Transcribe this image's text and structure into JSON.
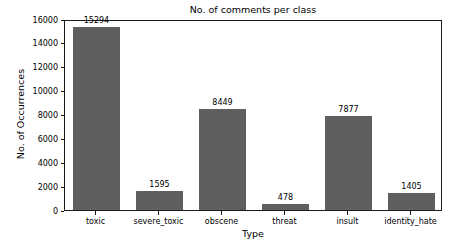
{
  "chart_data": {
    "type": "bar",
    "title": "No. of comments per class",
    "xlabel": "Type",
    "ylabel": "No. of Occurrences",
    "categories": [
      "toxic",
      "severe_toxic",
      "obscene",
      "threat",
      "insult",
      "identity_hate"
    ],
    "values": [
      15294,
      1595,
      8449,
      478,
      7877,
      1405
    ],
    "value_labels": [
      "15294",
      "1595",
      "8449",
      "478",
      "7877",
      "1405"
    ],
    "ylim": [
      0,
      16000
    ],
    "yticks": [
      0,
      2000,
      4000,
      6000,
      8000,
      10000,
      12000,
      14000,
      16000
    ],
    "ytick_labels": [
      "0",
      "2000",
      "4000",
      "6000",
      "8000",
      "10000",
      "12000",
      "14000",
      "16000"
    ],
    "grid": false,
    "legend": null,
    "bar_color": "#5f5f5f",
    "background_color": "#ffffff",
    "axis_color": "#1a1a1a"
  }
}
